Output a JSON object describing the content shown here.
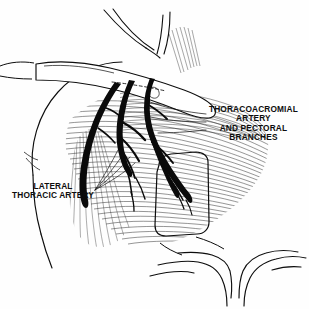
{
  "figure": {
    "type": "anatomical-line-illustration",
    "background_color": "#fefefe",
    "ink_color": "#0d0d0d",
    "width": 309,
    "height": 309
  },
  "labels": {
    "thoracoacromial": {
      "name": "thoracoacromial-artery-label",
      "lines": [
        "THORACOACROMIAL",
        "ARTERY",
        "AND PECTORAL",
        "BRANCHES"
      ],
      "align": "center",
      "color": "#0d0d0d"
    },
    "lateral_thoracic": {
      "name": "lateral-thoracic-artery-label",
      "lines": [
        "LATERAL",
        "THORACIC ARTERY"
      ],
      "align": "center",
      "color": "#0d0d0d"
    }
  },
  "structures": [
    {
      "name": "shoulder-deltoid-contour",
      "kind": "outline"
    },
    {
      "name": "neck-contour",
      "kind": "outline"
    },
    {
      "name": "clavicle",
      "kind": "outline"
    },
    {
      "name": "pectoralis-major-fibers",
      "kind": "hatching"
    },
    {
      "name": "pectoralis-minor-window",
      "kind": "outline"
    },
    {
      "name": "thoracoacromial-artery",
      "kind": "vessel"
    },
    {
      "name": "pectoral-branches",
      "kind": "vessel"
    },
    {
      "name": "lateral-thoracic-artery",
      "kind": "vessel"
    },
    {
      "name": "costal-margin",
      "kind": "outline"
    }
  ]
}
